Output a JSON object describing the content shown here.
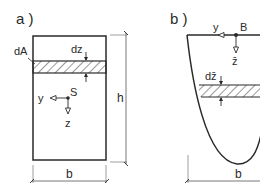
{
  "panel_a": {
    "label": "a )",
    "area_element_label": "dA",
    "strip_height_label": "dz",
    "centroid_label": "S",
    "y_axis_label": "y",
    "z_axis_label": "z",
    "height_label": "h",
    "width_label": "b"
  },
  "panel_b": {
    "label": "b )",
    "origin_label": "B",
    "y_axis_label": "y",
    "z_axis_label": "z̄",
    "strip_height_label": "dz̄",
    "width_label": "b"
  },
  "colors": {
    "stroke": "#2a2a2a",
    "dimension": "#555555",
    "background": "#ffffff"
  }
}
